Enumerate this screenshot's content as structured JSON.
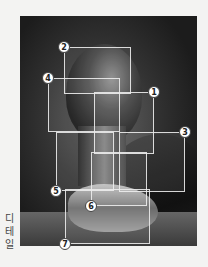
{
  "figure": {
    "side_label": [
      "디",
      "테",
      "일"
    ],
    "boxes": [
      {
        "number": "2",
        "left": 64,
        "top": 47,
        "width": 67,
        "height": 47,
        "badge_x": 64,
        "badge_y": 47
      },
      {
        "number": "4",
        "left": 48,
        "top": 78,
        "width": 72,
        "height": 54,
        "badge_x": 48,
        "badge_y": 78
      },
      {
        "number": "1",
        "left": 94,
        "top": 92,
        "width": 60,
        "height": 62,
        "badge_x": 154,
        "badge_y": 92
      },
      {
        "number": "3",
        "left": 119,
        "top": 132,
        "width": 66,
        "height": 60,
        "badge_x": 185,
        "badge_y": 132
      },
      {
        "number": "5",
        "left": 56,
        "top": 132,
        "width": 58,
        "height": 59,
        "badge_x": 56,
        "badge_y": 191
      },
      {
        "number": "6",
        "left": 91,
        "top": 152,
        "width": 56,
        "height": 54,
        "badge_x": 91,
        "badge_y": 206
      },
      {
        "number": "7",
        "left": 65,
        "top": 189,
        "width": 85,
        "height": 55,
        "badge_x": 65,
        "badge_y": 244
      }
    ]
  }
}
